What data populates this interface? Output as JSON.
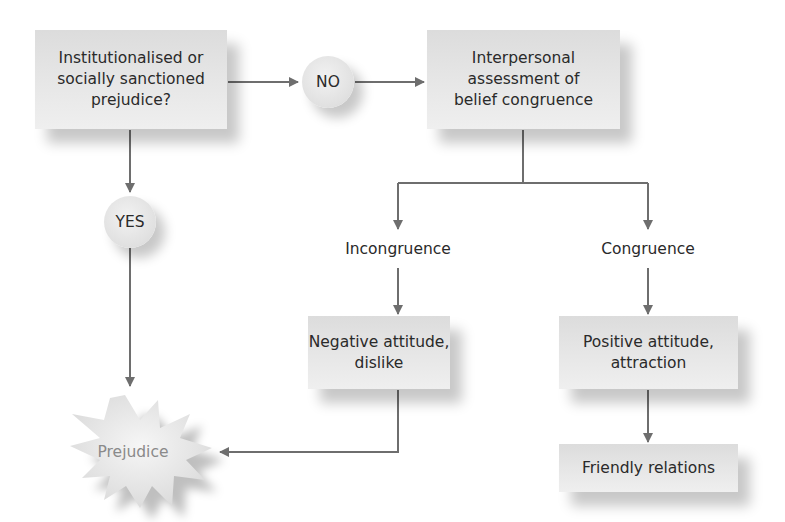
{
  "diagram": {
    "nodes": {
      "question": "Institutionalised or\nsocially sanctioned\nprejudice?",
      "no": "NO",
      "yes": "YES",
      "assessment": "Interpersonal\nassessment of\nbelief congruence",
      "incongruence": "Incongruence",
      "congruence": "Congruence",
      "negative": "Negative attitude,\ndislike",
      "positive": "Positive attitude,\nattraction",
      "friendly": "Friendly relations",
      "prejudice": "Prejudice"
    },
    "edges": [
      {
        "from": "question",
        "to": "no"
      },
      {
        "from": "no",
        "to": "assessment"
      },
      {
        "from": "question",
        "to": "yes"
      },
      {
        "from": "yes",
        "to": "prejudice"
      },
      {
        "from": "assessment",
        "to": "incongruence"
      },
      {
        "from": "assessment",
        "to": "congruence"
      },
      {
        "from": "incongruence",
        "to": "negative"
      },
      {
        "from": "congruence",
        "to": "positive"
      },
      {
        "from": "positive",
        "to": "friendly"
      },
      {
        "from": "negative",
        "to": "prejudice"
      }
    ],
    "colors": {
      "line": "#6e6e6e",
      "box": "#e4e4e4",
      "text": "#2a2a2a",
      "prejudice_text": "#8a8a8a"
    }
  }
}
